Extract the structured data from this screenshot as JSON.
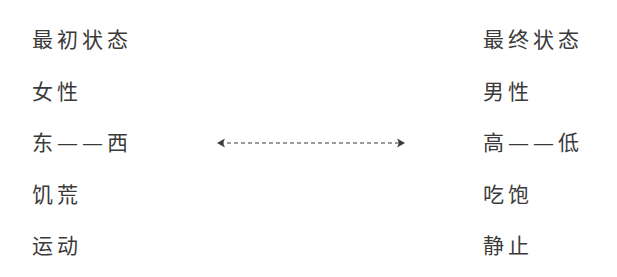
{
  "left_column": {
    "header": "最初状态",
    "items": [
      "女性",
      "东——西",
      "饥荒",
      "运动"
    ]
  },
  "right_column": {
    "header": "最终状态",
    "items": [
      "男性",
      "高——低",
      "吃饱",
      "静止"
    ]
  },
  "connector": {
    "type": "dashed-double-arrow",
    "color": "#3a3a3a"
  }
}
